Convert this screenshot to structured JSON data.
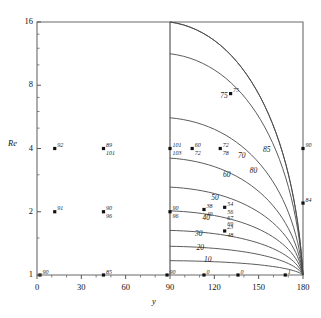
{
  "chart_data": {
    "type": "line",
    "title": "",
    "xlabel": "y",
    "ylabel": "Re",
    "xlim": [
      0,
      180
    ],
    "ylim": [
      1,
      16
    ],
    "yscale": "log2",
    "grid": false,
    "legend": "none",
    "xticks": [
      0,
      30,
      60,
      90,
      120,
      150,
      180
    ],
    "xtick_labels": [
      "0",
      "30",
      "60",
      "90",
      "120",
      "150",
      "180"
    ],
    "yticks": [
      1,
      2,
      4,
      8,
      16
    ],
    "ytick_labels": [
      "1",
      "2",
      "4",
      "8",
      "16"
    ],
    "divider_x": 90,
    "curves": [
      {
        "label": "10",
        "label_x": 117,
        "label_y": 1.16,
        "start_x": 90,
        "start_y": 1.17,
        "end_x": 180,
        "end_y": 1.0
      },
      {
        "label": "20",
        "label_x": 112,
        "label_y": 1.33,
        "start_x": 90,
        "start_y": 1.37,
        "end_x": 180,
        "end_y": 1.0
      },
      {
        "label": "30",
        "label_x": 111,
        "label_y": 1.55,
        "start_x": 90,
        "start_y": 1.63,
        "end_x": 180,
        "end_y": 1.0
      },
      {
        "label": "40",
        "label_x": 116,
        "label_y": 1.85,
        "start_x": 90,
        "start_y": 2.02,
        "end_x": 180,
        "end_y": 1.0
      },
      {
        "label": "50",
        "label_x": 122,
        "label_y": 2.3,
        "start_x": 90,
        "start_y": 2.62,
        "end_x": 180,
        "end_y": 1.0
      },
      {
        "label": "60",
        "label_x": 130,
        "label_y": 2.95,
        "start_x": 90,
        "start_y": 3.6,
        "end_x": 180,
        "end_y": 1.0
      },
      {
        "label": "70",
        "label_x": 140,
        "label_y": 3.65,
        "start_x": 90,
        "start_y": 5.6,
        "end_x": 180,
        "end_y": 1.0
      },
      {
        "label": "75",
        "label_x": 128,
        "label_y": 7.0,
        "start_x": 90,
        "start_y": 11.3,
        "end_x": 180,
        "end_y": 1.0
      },
      {
        "label": "85",
        "label_x": 157,
        "label_y": 3.9,
        "start_x": 90,
        "start_y": 16.0,
        "end_x": 180,
        "end_y": 1.0
      },
      {
        "label": "80",
        "label_x": 148,
        "label_y": 3.1,
        "start_x": 90,
        "start_y": 16.0,
        "end_x": 180,
        "end_y": 1.0
      }
    ],
    "points": [
      {
        "x": 12,
        "y": 4.0,
        "label_top": "92",
        "label_bot": ""
      },
      {
        "x": 45,
        "y": 4.0,
        "label_top": "89",
        "label_bot": "101"
      },
      {
        "x": 90,
        "y": 4.0,
        "label_top": "101",
        "label_bot": "103"
      },
      {
        "x": 12,
        "y": 2.0,
        "label_top": "91",
        "label_bot": ""
      },
      {
        "x": 45,
        "y": 2.0,
        "label_top": "90",
        "label_bot": "96"
      },
      {
        "x": 90,
        "y": 2.0,
        "label_top": "90",
        "label_bot": "96"
      },
      {
        "x": 2,
        "y": 1.0,
        "label_top": "90",
        "label_bot": ""
      },
      {
        "x": 45,
        "y": 1.0,
        "label_top": "85",
        "label_bot": ""
      },
      {
        "x": 88,
        "y": 1.0,
        "label_top": "90",
        "label_bot": ""
      },
      {
        "x": 113,
        "y": 1.0,
        "label_top": "0",
        "label_bot": ""
      },
      {
        "x": 136,
        "y": 1.0,
        "label_top": "0",
        "label_bot": ""
      },
      {
        "x": 168,
        "y": 1.0,
        "label_top": "1",
        "label_bot": ""
      },
      {
        "x": 105,
        "y": 4.0,
        "label_top": "60",
        "label_bot": "72"
      },
      {
        "x": 124,
        "y": 4.0,
        "label_top": "72",
        "label_bot": "78"
      },
      {
        "x": 131,
        "y": 7.3,
        "label_top": "75",
        "label_bot": ""
      },
      {
        "x": 180,
        "y": 4.0,
        "label_top": "90",
        "label_bot": ""
      },
      {
        "x": 180,
        "y": 2.2,
        "label_top": "84",
        "label_bot": ""
      },
      {
        "x": 113,
        "y": 2.05,
        "label_top": "38",
        "label_bot": "40"
      },
      {
        "x": 127,
        "y": 2.1,
        "label_top": "54",
        "label_bot": "56"
      },
      {
        "x": 127,
        "y": 1.62,
        "label_top": "23",
        "label_bot": "48"
      }
    ],
    "point_label_groups": [
      {
        "x": 127,
        "y": 2.1,
        "lines": [
          "54",
          "56",
          "67",
          "69"
        ]
      }
    ]
  }
}
